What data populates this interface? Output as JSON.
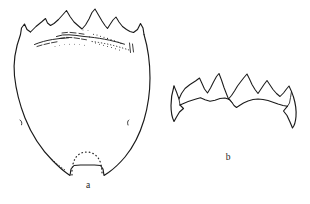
{
  "plate": {
    "title": "Comparative line drawings of sclerite and its anterior margin",
    "background_color": "#ffffff",
    "ink_color": "#1a1a1a",
    "width": 310,
    "height": 204
  },
  "figures": [
    {
      "id": "a",
      "label": "a",
      "label_x": 88,
      "label_y": 188,
      "caption": "Entire shield-shaped sclerite in dorsal view with dentate anterior margin and emarginate posterior border",
      "features": [
        "dentate anterior margin with five principal teeth",
        "transverse stippled ridge below anterior margin",
        "rounded lateral expansion at mid-length",
        "paired lateral setal punctures",
        "median posterior emargination with dotted internal arch"
      ]
    },
    {
      "id": "b",
      "label": "b",
      "label_x": 228,
      "label_y": 160,
      "caption": "Enlarged detail of the dentate anterior margin showing teeth and underlying carina",
      "features": [
        "outer dentate margin",
        "inner sinuate carina",
        "acute lateral angles produced as spurs"
      ]
    }
  ],
  "colors": {
    "ink": "#1a1a1a",
    "stipple": "#2b2b2b",
    "dotted": "#2f2f2f",
    "background": "#ffffff"
  }
}
